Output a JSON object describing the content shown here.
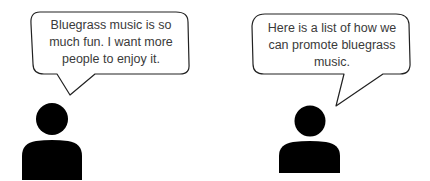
{
  "speakers": [
    {
      "id": "left",
      "icon": "person-icon",
      "speech": "Bluegrass music is so much fun. I want more people to enjoy it."
    },
    {
      "id": "right",
      "icon": "person-icon",
      "speech": "Here is a list of how we can promote bluegrass music."
    }
  ],
  "colors": {
    "background": "#ffffff",
    "outline": "#222222",
    "figure": "#000000",
    "text": "#3a3a3a"
  }
}
